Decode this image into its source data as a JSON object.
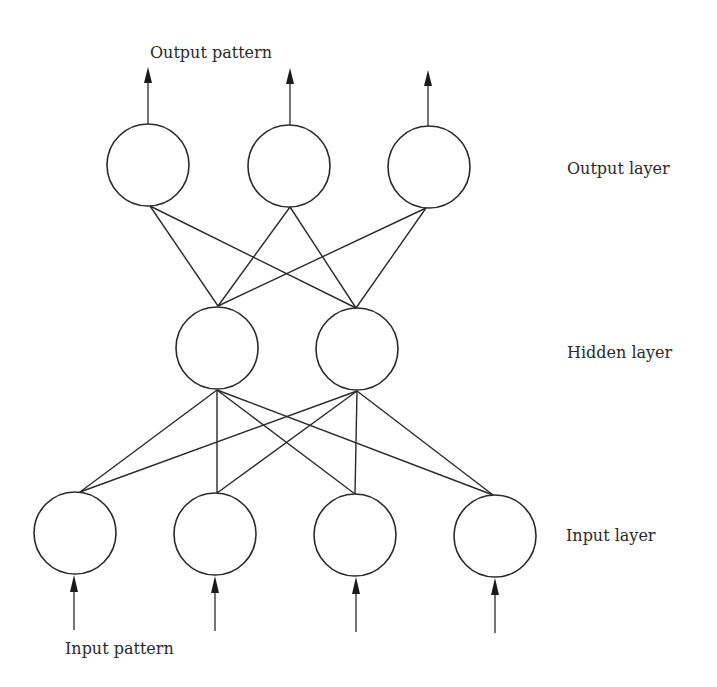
{
  "labels": {
    "output_pattern": "Output pattern",
    "input_pattern": "Input pattern",
    "output_layer": "Output layer",
    "hidden_layer": "Hidden layer",
    "input_layer": "Input layer"
  },
  "layers": {
    "output": {
      "name": "Output layer",
      "node_count": 3
    },
    "hidden": {
      "name": "Hidden layer",
      "node_count": 2
    },
    "input": {
      "name": "Input layer",
      "node_count": 4
    }
  },
  "connections": "fully connected between adjacent layers",
  "colors": {
    "stroke": "#2a2a2a",
    "background": "#ffffff"
  }
}
